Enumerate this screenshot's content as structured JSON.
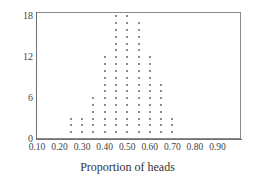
{
  "chart_data": {
    "type": "scatter",
    "plot_style": "dotplot",
    "title": "",
    "xlabel": "Proportion of heads",
    "ylabel": "",
    "xlim": [
      0.1,
      1.0
    ],
    "ylim": [
      0,
      18.5
    ],
    "grid": false,
    "legend": null,
    "xticks": [
      0.1,
      0.2,
      0.3,
      0.4,
      0.5,
      0.6,
      0.7,
      0.8,
      0.9
    ],
    "xtick_labels": [
      "0.10",
      "0.20",
      "0.30",
      "0.40",
      "0.50",
      "0.60",
      "0.70",
      "0.80",
      "0.90"
    ],
    "yticks": [
      0,
      6,
      12,
      18
    ],
    "ytick_labels": [
      "0",
      "6",
      "12",
      "18"
    ],
    "dot_color": "#8c8c8c",
    "axis_color": "#6e6e6e",
    "categories": [
      0.25,
      0.3,
      0.35,
      0.4,
      0.45,
      0.5,
      0.55,
      0.6,
      0.65,
      0.7
    ],
    "values": [
      3,
      3,
      6,
      12,
      18,
      18,
      17,
      12,
      8,
      3
    ],
    "series": [
      {
        "name": "Proportion of heads",
        "x": [
          0.25,
          0.3,
          0.35,
          0.4,
          0.45,
          0.5,
          0.55,
          0.6,
          0.65,
          0.7
        ],
        "values": [
          3,
          3,
          6,
          12,
          18,
          18,
          17,
          12,
          8,
          3
        ]
      }
    ]
  }
}
